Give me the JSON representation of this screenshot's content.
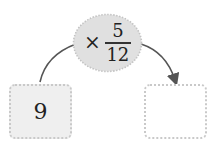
{
  "operator": {
    "symbol": "×",
    "numerator": "5",
    "denominator": "12"
  },
  "input_box": {
    "value": "9"
  },
  "output_box": {
    "value": ""
  },
  "colors": {
    "ellipse_fill": "#e0e0e0",
    "box_fill": "#efefef",
    "arrow": "#555555",
    "dotted_border": "#c9c9c9"
  }
}
